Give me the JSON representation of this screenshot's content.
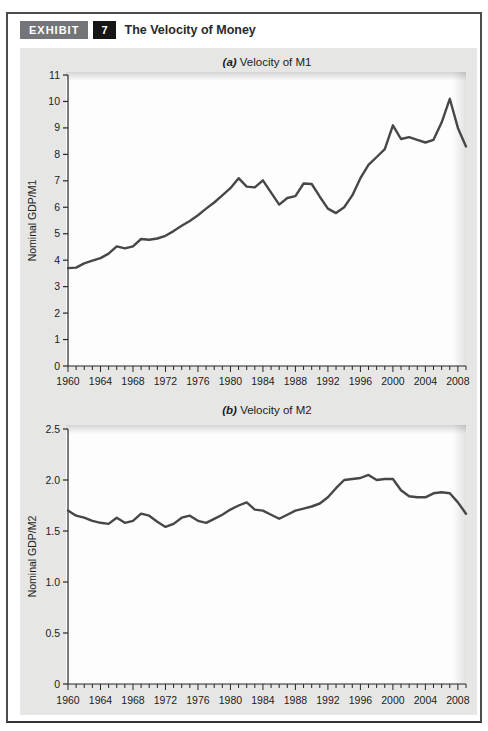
{
  "page": {
    "exhibit_label": "EXHIBIT",
    "exhibit_number": "7",
    "title": "The Velocity of Money"
  },
  "colors": {
    "line": "#474747",
    "axis": "#262626",
    "panel_bg": "#e6e6e5",
    "plot_bg": "#fdfdfd",
    "badge_gray": "#747578",
    "badge_black": "#161616",
    "text": "#1c1c1c"
  },
  "chart_data": [
    {
      "type": "line",
      "name": "m1",
      "title_prefix": "(a)",
      "title": "Velocity of M1",
      "ylabel": "Nominal GDP/M1",
      "xlabel": "",
      "grid": false,
      "legend": "none",
      "years": {
        "start": 1960,
        "end": 2009,
        "step": 1
      },
      "ylim": [
        0,
        11
      ],
      "ytick_step": 1,
      "ytick_labels": [
        "0",
        "1",
        "2",
        "3",
        "4",
        "5",
        "6",
        "7",
        "8",
        "9",
        "10",
        "11"
      ],
      "xtick_labels": [
        "1960",
        "1964",
        "1968",
        "1972",
        "1976",
        "1980",
        "1984",
        "1988",
        "1992",
        "1996",
        "2000",
        "2004",
        "2008"
      ],
      "values": [
        3.7,
        3.72,
        3.88,
        3.98,
        4.08,
        4.25,
        4.52,
        4.45,
        4.52,
        4.8,
        4.77,
        4.82,
        4.92,
        5.1,
        5.3,
        5.48,
        5.7,
        5.95,
        6.18,
        6.45,
        6.72,
        7.1,
        6.78,
        6.75,
        7.02,
        6.55,
        6.1,
        6.35,
        6.42,
        6.9,
        6.88,
        6.4,
        5.95,
        5.78,
        6.0,
        6.45,
        7.1,
        7.6,
        7.9,
        8.2,
        9.1,
        8.58,
        8.65,
        8.55,
        8.45,
        8.55,
        9.2,
        10.1,
        9.0,
        8.3
      ]
    },
    {
      "type": "line",
      "name": "m2",
      "title_prefix": "(b)",
      "title": "Velocity of M2",
      "ylabel": "Nominal GDP/M2",
      "xlabel": "",
      "grid": false,
      "legend": "none",
      "years": {
        "start": 1960,
        "end": 2009,
        "step": 1
      },
      "ylim": [
        0,
        2.5
      ],
      "ytick_step": 0.5,
      "ytick_labels": [
        "0",
        "0.5",
        "1.0",
        "1.5",
        "2.0",
        "2.5"
      ],
      "xtick_labels": [
        "1960",
        "1964",
        "1968",
        "1972",
        "1976",
        "1980",
        "1984",
        "1988",
        "1992",
        "1996",
        "2000",
        "2004",
        "2008"
      ],
      "values": [
        1.7,
        1.65,
        1.63,
        1.6,
        1.58,
        1.57,
        1.63,
        1.58,
        1.6,
        1.67,
        1.65,
        1.59,
        1.54,
        1.57,
        1.63,
        1.65,
        1.6,
        1.58,
        1.62,
        1.66,
        1.71,
        1.75,
        1.78,
        1.71,
        1.7,
        1.66,
        1.62,
        1.66,
        1.7,
        1.72,
        1.74,
        1.77,
        1.83,
        1.92,
        2.0,
        2.01,
        2.02,
        2.05,
        2.0,
        2.01,
        2.01,
        1.9,
        1.84,
        1.83,
        1.83,
        1.87,
        1.88,
        1.87,
        1.78,
        1.67
      ]
    }
  ]
}
